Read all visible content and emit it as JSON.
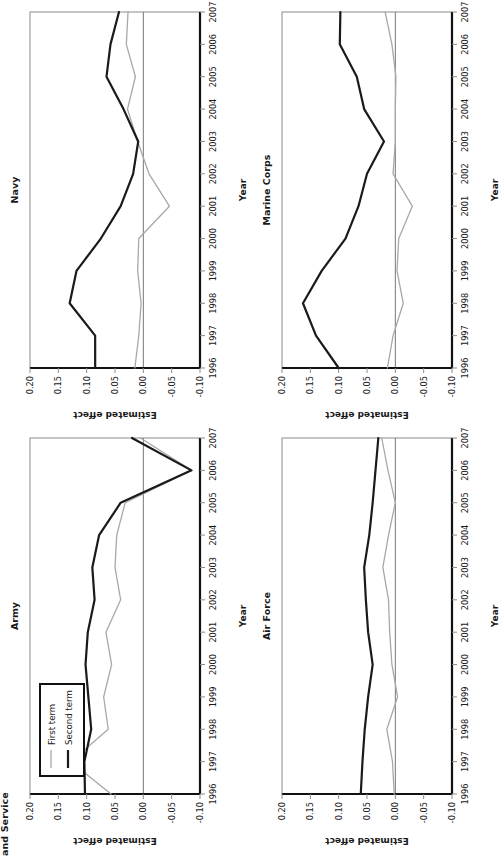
{
  "figure": {
    "cut_off_header": "and Service",
    "axis": {
      "xlabel": "Year",
      "ylabel": "Estimated effect",
      "xticks": [
        "1996",
        "1997",
        "1998",
        "1999",
        "2000",
        "2001",
        "2002",
        "2003",
        "2004",
        "2005",
        "2006",
        "2007"
      ],
      "yticks": [
        "0.20",
        "0.15",
        "0.10",
        "0.05",
        "0.00",
        "-0.05",
        "-0.10"
      ],
      "ylim": [
        -0.1,
        0.2
      ],
      "xlim": [
        1996,
        2007
      ]
    },
    "legend": {
      "position": "top-left of Army panel",
      "entries": [
        {
          "label": "First term",
          "color": "#a8a8a8"
        },
        {
          "label": "Second term",
          "color": "#1a1a1a"
        }
      ]
    },
    "colors": {
      "first_term": "#a8a8a8",
      "second_term": "#1a1a1a",
      "frame": "#8c8c8c",
      "axis": "#111111",
      "zero": "#777777"
    }
  },
  "chart_data": [
    {
      "type": "line",
      "title": "Army",
      "xlabel": "Year",
      "ylabel": "Estimated effect",
      "x": [
        1996,
        1997,
        1998,
        1999,
        2000,
        2001,
        2002,
        2003,
        2004,
        2005,
        2006,
        2007
      ],
      "ylim": [
        -0.1,
        0.2
      ],
      "grid": false,
      "legend": [
        "First term",
        "Second term"
      ],
      "series": [
        {
          "name": "First term",
          "color": "#a8a8a8",
          "values": [
            0.057,
            0.128,
            0.062,
            0.07,
            0.056,
            0.066,
            0.04,
            0.05,
            0.047,
            0.032,
            -0.085,
            0.005
          ]
        },
        {
          "name": "Second term",
          "color": "#1a1a1a",
          "values": [
            0.103,
            0.104,
            0.092,
            0.097,
            0.102,
            0.098,
            0.086,
            0.09,
            0.078,
            0.04,
            -0.085,
            0.02
          ]
        }
      ]
    },
    {
      "type": "line",
      "title": "Navy",
      "xlabel": "Year",
      "ylabel": "Estimated effect",
      "x": [
        1996,
        1997,
        1998,
        1999,
        2000,
        2001,
        2002,
        2003,
        2004,
        2005,
        2006,
        2007
      ],
      "ylim": [
        -0.1,
        0.2
      ],
      "grid": false,
      "legend": [
        "First term",
        "Second term"
      ],
      "series": [
        {
          "name": "First term",
          "color": "#a8a8a8",
          "values": [
            0.015,
            0.008,
            0.004,
            0.01,
            0.008,
            -0.046,
            -0.01,
            0.01,
            0.028,
            0.014,
            0.03,
            0.027
          ]
        },
        {
          "name": "Second term",
          "color": "#1a1a1a",
          "values": [
            0.085,
            0.085,
            0.13,
            0.118,
            0.075,
            0.04,
            0.018,
            0.009,
            0.035,
            0.065,
            0.058,
            0.043
          ]
        }
      ]
    },
    {
      "type": "line",
      "title": "Air Force",
      "xlabel": "Year",
      "ylabel": "Estimated effect",
      "x": [
        1996,
        1997,
        1998,
        1999,
        2000,
        2001,
        2002,
        2003,
        2004,
        2005,
        2006,
        2007
      ],
      "ylim": [
        -0.1,
        0.2
      ],
      "grid": false,
      "legend": [
        "First term",
        "Second term"
      ],
      "series": [
        {
          "name": "First term",
          "color": "#a8a8a8",
          "values": [
            0.002,
            0.005,
            0.015,
            -0.004,
            0.006,
            0.01,
            0.012,
            0.022,
            0.012,
            0.0,
            0.013,
            0.024
          ]
        },
        {
          "name": "Second term",
          "color": "#1a1a1a",
          "values": [
            0.061,
            0.058,
            0.054,
            0.048,
            0.04,
            0.048,
            0.052,
            0.055,
            0.046,
            0.04,
            0.035,
            0.03
          ]
        }
      ]
    },
    {
      "type": "line",
      "title": "Marine Corps",
      "xlabel": "Year",
      "ylabel": "Estimated effect",
      "x": [
        1996,
        1997,
        1998,
        1999,
        2000,
        2001,
        2002,
        2003,
        2004,
        2005,
        2006,
        2007
      ],
      "ylim": [
        -0.1,
        0.2
      ],
      "grid": false,
      "legend": [
        "First term",
        "Second term"
      ],
      "series": [
        {
          "name": "First term",
          "color": "#a8a8a8",
          "values": [
            0.014,
            0.004,
            -0.014,
            -0.003,
            -0.006,
            -0.03,
            0.004,
            0.0,
            0.0,
            -0.001,
            0.006,
            0.018
          ]
        },
        {
          "name": "Second term",
          "color": "#1a1a1a",
          "values": [
            0.1,
            0.14,
            0.163,
            0.13,
            0.088,
            0.065,
            0.05,
            0.02,
            0.055,
            0.068,
            0.098,
            0.097
          ]
        }
      ]
    }
  ]
}
